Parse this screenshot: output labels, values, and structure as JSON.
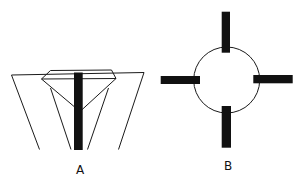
{
  "figure": {
    "panels": [
      {
        "id": "A",
        "label": "A",
        "description": "Gemstone (brilliant cut) viewed from the side, seated in a prong setting with a dark vertical bar through its center"
      },
      {
        "id": "B",
        "label": "B",
        "description": "Circle with four dark rectangular bars at top, bottom, left and right"
      }
    ],
    "colors": {
      "line": "#1a1a1a",
      "bar": "#111111",
      "background": "#ffffff"
    }
  }
}
